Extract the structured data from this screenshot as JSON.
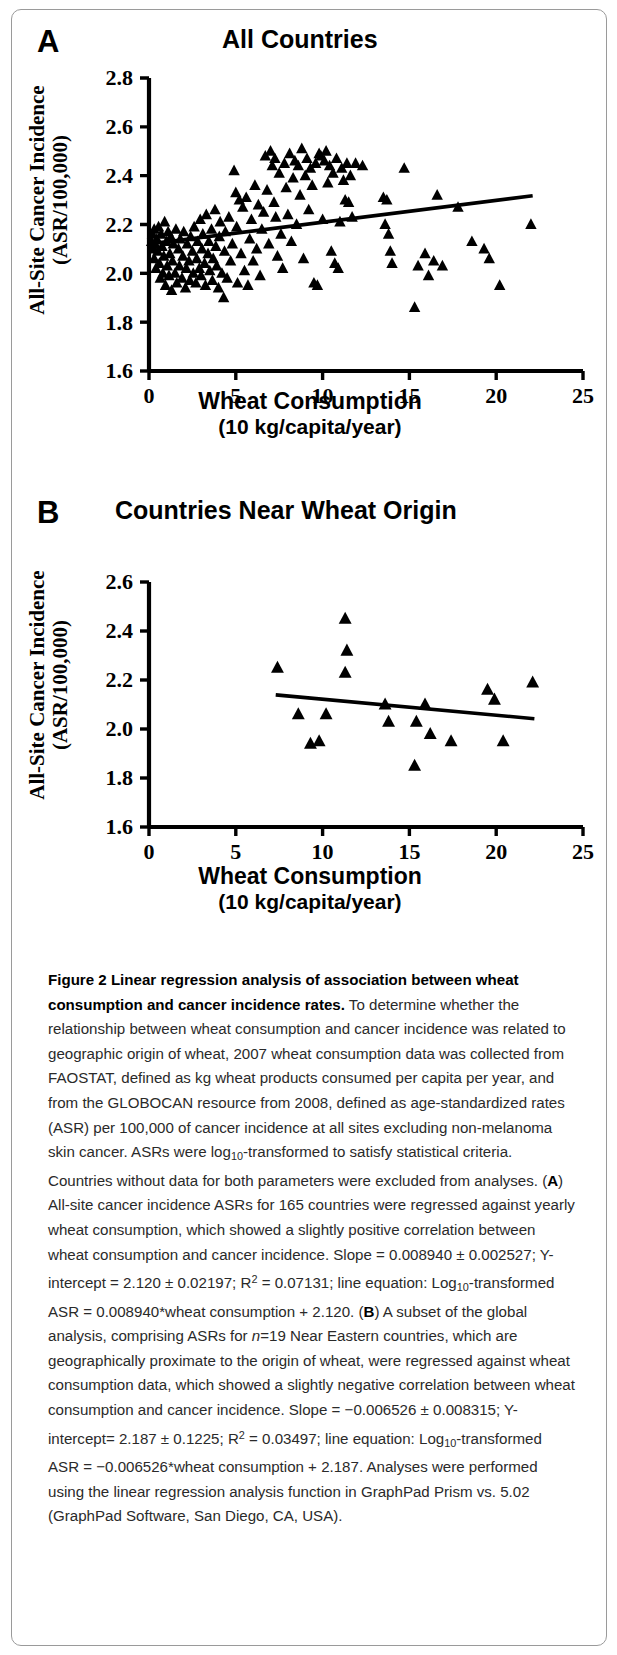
{
  "figure": {
    "panel_a": {
      "letter": "A",
      "title": "All Countries",
      "ylabel_line1": "All-Site Cancer Incidence",
      "ylabel_line2": "(ASR/100,000)",
      "xlabel_line1": "Wheat Consumption",
      "xlabel_line2": "(10 kg/capita/year)"
    },
    "panel_b": {
      "letter": "B",
      "title": "Countries Near Wheat Origin",
      "ylabel_line1": "All-Site Cancer Incidence",
      "ylabel_line2": "(ASR/100,000)",
      "xlabel_line1": "Wheat Consumption",
      "xlabel_line2": "(10 kg/capita/year)"
    },
    "marker_color": "#000000",
    "line_color": "#000000",
    "axis_color": "#000000"
  },
  "caption": {
    "title_bold": "Figure 2 Linear regression analysis of association between wheat consumption and cancer incidence rates.",
    "body_1": " To determine whether the relationship between wheat consumption and cancer incidence was related to geographic origin of wheat, 2007 wheat consumption data was collected from FAOSTAT, defined as kg wheat products consumed per capita per year, and from the GLOBOCAN resource from 2008, defined as age-standardized rates (ASR) per 100,000 of cancer incidence at all sites excluding non-melanoma skin cancer. ASRs were log",
    "sub_10_a": "10",
    "body_2": "-transformed to satisfy statistical criteria. Countries without data for both parameters were excluded from analyses. (",
    "bold_A": "A",
    "body_3": ") All-site cancer incidence ASRs for 165 countries were regressed against yearly wheat consumption, which showed a slightly positive correlation between wheat consumption and cancer incidence. Slope = 0.008940 ± 0.002527; Y-intercept = 2.120 ± 0.02197; R",
    "sup_2_a": "2",
    "body_4": " = 0.07131; line equation: Log",
    "sub_10_b": "10",
    "body_5": "-transformed ASR = 0.008940*wheat consumption + 2.120. (",
    "bold_B": "B",
    "body_6": ") A subset of the global analysis, comprising ASRs for ",
    "italic_n": "n",
    "body_7": "=19 Near Eastern countries, which are geographically proximate to the origin of wheat, were regressed against wheat consumption data, which showed a slightly negative correlation between wheat consumption and cancer incidence. Slope = −0.006526 ± 0.008315; Y-intercept= 2.187 ± 0.1225; R",
    "sup_2_b": "2",
    "body_8": " = 0.03497; line equation: Log",
    "sub_10_c": "10",
    "body_9": "-transformed ASR = −0.006526*wheat consumption + 2.187. Analyses were performed using the linear regression analysis function in GraphPad Prism vs. 5.02 (GraphPad Software, San Diego, CA, USA)."
  },
  "chart_data": [
    {
      "type": "scatter",
      "panel": "A",
      "title": "All Countries",
      "xlabel": "Wheat Consumption (10 kg/capita/year)",
      "ylabel": "All-Site Cancer Incidence (ASR/100,000)",
      "xlim": [
        0,
        25
      ],
      "ylim": [
        1.6,
        2.8
      ],
      "xticks": [
        0,
        5,
        10,
        15,
        20,
        25
      ],
      "yticks": [
        1.6,
        1.8,
        2.0,
        2.2,
        2.4,
        2.6,
        2.8
      ],
      "grid": false,
      "legend": "none",
      "marker": "triangle-up",
      "n_points": 165,
      "fit_line": {
        "slope": 0.00894,
        "slope_sem": 0.002527,
        "intercept": 2.12,
        "intercept_sem": 0.02197,
        "r_squared": 0.07131,
        "x_start": 0.1,
        "x_end": 22.1,
        "equation": "Log10-transformed ASR = 0.008940*wheat consumption + 2.120"
      },
      "points": [
        [
          0.15,
          2.13
        ],
        [
          0.2,
          2.16
        ],
        [
          0.25,
          2.1
        ],
        [
          0.3,
          2.18
        ],
        [
          0.3,
          2.06
        ],
        [
          0.35,
          2.12
        ],
        [
          0.4,
          2.02
        ],
        [
          0.45,
          2.14
        ],
        [
          0.5,
          2.09
        ],
        [
          0.55,
          2.19
        ],
        [
          0.6,
          2.04
        ],
        [
          0.65,
          1.98
        ],
        [
          0.7,
          2.16
        ],
        [
          0.75,
          2.11
        ],
        [
          0.8,
          2.0
        ],
        [
          0.85,
          2.07
        ],
        [
          0.9,
          2.21
        ],
        [
          0.95,
          1.95
        ],
        [
          1.0,
          2.13
        ],
        [
          1.05,
          2.03
        ],
        [
          1.1,
          2.17
        ],
        [
          1.15,
          1.99
        ],
        [
          1.2,
          2.08
        ],
        [
          1.25,
          2.15
        ],
        [
          1.3,
          1.93
        ],
        [
          1.35,
          2.05
        ],
        [
          1.4,
          2.12
        ],
        [
          1.5,
          2.0
        ],
        [
          1.55,
          2.18
        ],
        [
          1.6,
          1.96
        ],
        [
          1.7,
          2.1
        ],
        [
          1.75,
          2.03
        ],
        [
          1.8,
          2.14
        ],
        [
          1.9,
          1.98
        ],
        [
          1.95,
          2.07
        ],
        [
          2.0,
          2.17
        ],
        [
          2.1,
          1.94
        ],
        [
          2.15,
          2.02
        ],
        [
          2.2,
          2.12
        ],
        [
          2.3,
          2.05
        ],
        [
          2.35,
          1.97
        ],
        [
          2.4,
          2.15
        ],
        [
          2.5,
          2.09
        ],
        [
          2.55,
          2.0
        ],
        [
          2.6,
          2.19
        ],
        [
          2.7,
          1.96
        ],
        [
          2.75,
          2.06
        ],
        [
          2.8,
          2.13
        ],
        [
          2.9,
          2.02
        ],
        [
          2.95,
          2.22
        ],
        [
          3.0,
          1.99
        ],
        [
          3.05,
          2.1
        ],
        [
          3.1,
          2.16
        ],
        [
          3.2,
          2.04
        ],
        [
          3.25,
          1.95
        ],
        [
          3.3,
          2.24
        ],
        [
          3.4,
          2.08
        ],
        [
          3.45,
          2.13
        ],
        [
          3.5,
          2.01
        ],
        [
          3.6,
          2.18
        ],
        [
          3.65,
          1.97
        ],
        [
          3.7,
          2.06
        ],
        [
          3.8,
          2.26
        ],
        [
          3.85,
          2.11
        ],
        [
          3.9,
          2.03
        ],
        [
          4.0,
          1.94
        ],
        [
          4.05,
          2.15
        ],
        [
          4.1,
          2.21
        ],
        [
          4.2,
          2.0
        ],
        [
          4.3,
          1.9
        ],
        [
          4.35,
          2.09
        ],
        [
          4.4,
          2.17
        ],
        [
          4.5,
          1.98
        ],
        [
          4.6,
          2.23
        ],
        [
          4.7,
          2.05
        ],
        [
          4.8,
          2.12
        ],
        [
          4.9,
          2.42
        ],
        [
          5.0,
          2.33
        ],
        [
          5.05,
          2.19
        ],
        [
          5.1,
          1.96
        ],
        [
          5.2,
          2.3
        ],
        [
          5.3,
          2.08
        ],
        [
          5.4,
          2.27
        ],
        [
          5.5,
          2.01
        ],
        [
          5.6,
          2.31
        ],
        [
          5.7,
          1.95
        ],
        [
          5.8,
          2.14
        ],
        [
          5.9,
          2.22
        ],
        [
          6.0,
          2.05
        ],
        [
          6.1,
          2.36
        ],
        [
          6.2,
          2.1
        ],
        [
          6.3,
          2.28
        ],
        [
          6.4,
          1.99
        ],
        [
          6.5,
          2.18
        ],
        [
          6.6,
          2.25
        ],
        [
          6.7,
          2.48
        ],
        [
          6.8,
          2.34
        ],
        [
          6.9,
          2.12
        ],
        [
          7.0,
          2.5
        ],
        [
          7.1,
          2.44
        ],
        [
          7.2,
          2.29
        ],
        [
          7.25,
          2.47
        ],
        [
          7.3,
          2.23
        ],
        [
          7.4,
          2.07
        ],
        [
          7.5,
          2.41
        ],
        [
          7.6,
          2.16
        ],
        [
          7.7,
          2.02
        ],
        [
          7.8,
          2.45
        ],
        [
          7.9,
          2.35
        ],
        [
          8.0,
          2.24
        ],
        [
          8.1,
          2.49
        ],
        [
          8.2,
          2.13
        ],
        [
          8.3,
          2.39
        ],
        [
          8.4,
          2.46
        ],
        [
          8.5,
          2.2
        ],
        [
          8.6,
          2.44
        ],
        [
          8.7,
          2.32
        ],
        [
          8.8,
          2.51
        ],
        [
          8.9,
          2.06
        ],
        [
          9.0,
          2.4
        ],
        [
          9.1,
          2.47
        ],
        [
          9.2,
          2.26
        ],
        [
          9.3,
          2.43
        ],
        [
          9.4,
          2.36
        ],
        [
          9.5,
          1.96
        ],
        [
          9.6,
          2.45
        ],
        [
          9.7,
          1.95
        ],
        [
          9.8,
          2.49
        ],
        [
          9.9,
          2.48
        ],
        [
          10.0,
          2.22
        ],
        [
          10.1,
          2.46
        ],
        [
          10.2,
          2.5
        ],
        [
          10.3,
          2.37
        ],
        [
          10.4,
          2.44
        ],
        [
          10.5,
          2.09
        ],
        [
          10.6,
          2.41
        ],
        [
          10.7,
          2.04
        ],
        [
          10.8,
          2.47
        ],
        [
          10.9,
          2.02
        ],
        [
          11.0,
          2.21
        ],
        [
          11.1,
          2.43
        ],
        [
          11.2,
          2.38
        ],
        [
          11.3,
          2.3
        ],
        [
          11.4,
          2.45
        ],
        [
          11.5,
          2.29
        ],
        [
          11.6,
          2.4
        ],
        [
          11.7,
          2.23
        ],
        [
          11.9,
          2.45
        ],
        [
          12.3,
          2.44
        ],
        [
          13.5,
          2.31
        ],
        [
          13.6,
          2.2
        ],
        [
          13.7,
          2.3
        ],
        [
          13.8,
          2.16
        ],
        [
          13.9,
          2.09
        ],
        [
          14.0,
          2.04
        ],
        [
          14.7,
          2.43
        ],
        [
          15.3,
          1.86
        ],
        [
          15.5,
          2.03
        ],
        [
          15.9,
          2.08
        ],
        [
          16.1,
          1.99
        ],
        [
          16.4,
          2.05
        ],
        [
          16.6,
          2.32
        ],
        [
          16.9,
          2.03
        ],
        [
          17.8,
          2.27
        ],
        [
          18.6,
          2.13
        ],
        [
          19.3,
          2.1
        ],
        [
          19.6,
          2.06
        ],
        [
          20.2,
          1.95
        ],
        [
          22.0,
          2.2
        ]
      ]
    },
    {
      "type": "scatter",
      "panel": "B",
      "title": "Countries Near Wheat Origin",
      "xlabel": "Wheat Consumption (10 kg/capita/year)",
      "ylabel": "All-Site Cancer Incidence (ASR/100,000)",
      "xlim": [
        0,
        25
      ],
      "ylim": [
        1.6,
        2.6
      ],
      "xticks": [
        0,
        5,
        10,
        15,
        20,
        25
      ],
      "yticks": [
        1.6,
        1.8,
        2.0,
        2.2,
        2.4,
        2.6
      ],
      "grid": false,
      "legend": "none",
      "marker": "triangle-up",
      "n_points": 19,
      "fit_line": {
        "slope": -0.006526,
        "slope_sem": 0.008315,
        "intercept": 2.187,
        "intercept_sem": 0.1225,
        "r_squared": 0.03497,
        "x_start": 7.3,
        "x_end": 22.2,
        "equation": "Log10-transformed ASR = -0.006526*wheat consumption + 2.187"
      },
      "points": [
        [
          7.4,
          2.25
        ],
        [
          8.6,
          2.06
        ],
        [
          9.3,
          1.94
        ],
        [
          9.8,
          1.95
        ],
        [
          10.2,
          2.06
        ],
        [
          11.3,
          2.45
        ],
        [
          11.4,
          2.32
        ],
        [
          11.3,
          2.23
        ],
        [
          13.6,
          2.1
        ],
        [
          13.8,
          2.03
        ],
        [
          15.3,
          1.85
        ],
        [
          15.4,
          2.03
        ],
        [
          15.9,
          2.1
        ],
        [
          16.2,
          1.98
        ],
        [
          17.4,
          1.95
        ],
        [
          19.5,
          2.16
        ],
        [
          19.9,
          2.12
        ],
        [
          20.4,
          1.95
        ],
        [
          22.1,
          2.19
        ]
      ]
    }
  ]
}
